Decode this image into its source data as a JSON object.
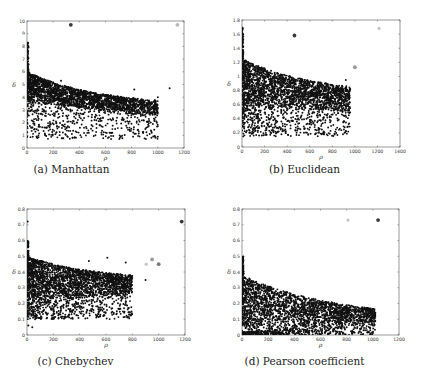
{
  "chart_data": [
    {
      "id": "a",
      "type": "scatter",
      "caption": "(a) Manhattan",
      "xlabel": "ρ",
      "ylabel": "δ",
      "xlim": [
        0,
        1200
      ],
      "ylim": [
        0,
        10
      ],
      "xticks": [
        0,
        200,
        400,
        600,
        800,
        1000,
        1200
      ],
      "yticks": [
        0,
        1,
        2,
        3,
        4,
        5,
        6,
        7,
        8,
        9,
        10
      ],
      "frame_px": {
        "left": 27,
        "top": 21,
        "right": 184,
        "bottom": 148
      },
      "grid": false,
      "cluster": {
        "n": 2600,
        "xmax": 1000,
        "upper_start": 6.0,
        "upper_end": 3.3,
        "upper_decay": 0.0018,
        "lower_start": 3.6,
        "lower_end": 2.4,
        "sparse_low_min": 0.7,
        "spike_top": 8.3
      },
      "highlight_points": [
        {
          "x": 335,
          "y": 9.7,
          "shade": "#3a3a3a",
          "r": 1.9
        },
        {
          "x": 1150,
          "y": 9.7,
          "shade": "#b8b8b8",
          "r": 1.9
        }
      ],
      "stray_points": [
        {
          "x": 1090,
          "y": 4.7
        },
        {
          "x": 820,
          "y": 4.6
        },
        {
          "x": 1000,
          "y": 4.0
        },
        {
          "x": 260,
          "y": 5.3
        }
      ]
    },
    {
      "id": "b",
      "type": "scatter",
      "caption": "(b) Euclidean",
      "xlabel": "ρ",
      "ylabel": "δ",
      "xlim": [
        0,
        1400
      ],
      "ylim": [
        0,
        1.8
      ],
      "xticks": [
        0,
        200,
        400,
        600,
        800,
        1000,
        1200,
        1400
      ],
      "yticks": [
        0,
        0.2,
        0.4,
        0.6,
        0.8,
        1,
        1.2,
        1.4,
        1.6,
        1.8
      ],
      "frame_px": {
        "left": 242,
        "top": 20,
        "right": 400,
        "bottom": 147
      },
      "grid": false,
      "cluster": {
        "n": 2600,
        "xmax": 960,
        "upper_start": 1.25,
        "upper_end": 0.75,
        "upper_decay": 0.0016,
        "lower_start": 0.55,
        "lower_end": 0.5,
        "sparse_low_min": 0.15,
        "spike_top": 1.7
      },
      "highlight_points": [
        {
          "x": 465,
          "y": 1.58,
          "shade": "#3a3a3a",
          "r": 1.9
        },
        {
          "x": 1000,
          "y": 1.13,
          "shade": "#9a9a9a",
          "r": 1.9
        },
        {
          "x": 1215,
          "y": 1.68,
          "shade": "#c4c4c4",
          "r": 1.6
        }
      ],
      "stray_points": [
        {
          "x": 920,
          "y": 0.95
        },
        {
          "x": 890,
          "y": 0.85
        },
        {
          "x": 950,
          "y": 0.72
        }
      ]
    },
    {
      "id": "c",
      "type": "scatter",
      "caption": "(c) Chebychev",
      "xlabel": "ρ",
      "ylabel": "δ",
      "xlim": [
        0,
        1200
      ],
      "ylim": [
        0,
        0.8
      ],
      "xticks": [
        0,
        200,
        400,
        600,
        800,
        1000,
        1200
      ],
      "yticks": [
        0,
        0.1,
        0.2,
        0.3,
        0.4,
        0.5,
        0.6,
        0.7,
        0.8
      ],
      "frame_px": {
        "left": 27,
        "top": 209,
        "right": 185,
        "bottom": 335
      },
      "grid": false,
      "cluster": {
        "n": 2600,
        "xmax": 800,
        "upper_start": 0.5,
        "upper_end": 0.35,
        "upper_decay": 0.002,
        "lower_start": 0.2,
        "lower_end": 0.26,
        "sparse_low_min": 0.1,
        "spike_top": 0.6
      },
      "highlight_points": [
        {
          "x": 1175,
          "y": 0.72,
          "shade": "#3a3a3a",
          "r": 1.9
        },
        {
          "x": 950,
          "y": 0.48,
          "shade": "#9a9a9a",
          "r": 1.9
        },
        {
          "x": 1000,
          "y": 0.45,
          "shade": "#7a7a7a",
          "r": 1.9
        },
        {
          "x": 905,
          "y": 0.45,
          "shade": "#c4c4c4",
          "r": 1.6
        }
      ],
      "stray_points": [
        {
          "x": 5,
          "y": 0.72
        },
        {
          "x": 10,
          "y": 0.06
        },
        {
          "x": 40,
          "y": 0.05
        },
        {
          "x": 610,
          "y": 0.49
        },
        {
          "x": 750,
          "y": 0.46
        },
        {
          "x": 470,
          "y": 0.47
        },
        {
          "x": 900,
          "y": 0.35
        }
      ]
    },
    {
      "id": "d",
      "type": "scatter",
      "caption": "(d) Pearson coefficient",
      "xlabel": "ρ",
      "ylabel": "δ",
      "xlim": [
        0,
        1200
      ],
      "ylim": [
        0,
        0.8
      ],
      "xticks": [
        0,
        200,
        400,
        600,
        800,
        1000,
        1200
      ],
      "yticks": [
        0,
        0.1,
        0.2,
        0.3,
        0.4,
        0.5,
        0.6,
        0.7,
        0.8
      ],
      "frame_px": {
        "left": 242,
        "top": 209,
        "right": 399,
        "bottom": 335
      },
      "grid": false,
      "cluster": {
        "n": 2600,
        "xmax": 1020,
        "upper_start": 0.38,
        "upper_end": 0.1,
        "upper_decay": 0.0014,
        "lower_start": 0.02,
        "lower_end": 0.07,
        "sparse_low_min": 0.0,
        "spike_top": 0.5
      },
      "highlight_points": [
        {
          "x": 1040,
          "y": 0.73,
          "shade": "#3a3a3a",
          "r": 1.9
        },
        {
          "x": 810,
          "y": 0.73,
          "shade": "#c4c4c4",
          "r": 1.6
        }
      ],
      "stray_points": [
        {
          "x": 800,
          "y": 0.05
        },
        {
          "x": 1010,
          "y": 0.07
        }
      ]
    }
  ]
}
